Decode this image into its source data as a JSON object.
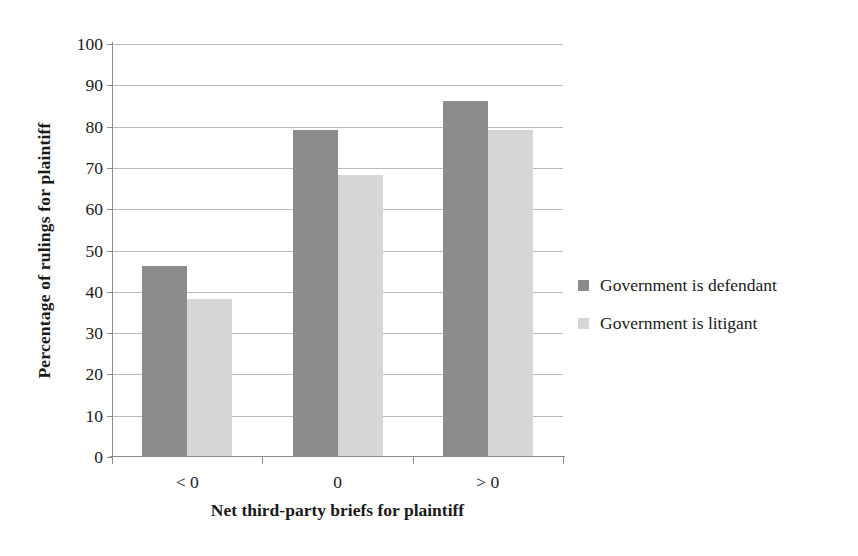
{
  "chart_data": {
    "type": "bar",
    "title": "",
    "xlabel": "Net third-party briefs for plaintiff",
    "ylabel": "Percentage of rulings for plaintiff",
    "categories": [
      "< 0",
      "0",
      "> 0"
    ],
    "series": [
      {
        "name": "Government is defendant",
        "color": "#8c8c8c",
        "values": [
          46,
          79,
          86
        ]
      },
      {
        "name": "Government is litigant",
        "color": "#d6d6d6",
        "values": [
          38,
          68,
          79
        ]
      }
    ],
    "ylim": [
      0,
      100
    ],
    "yticks": [
      0,
      10,
      20,
      30,
      40,
      50,
      60,
      70,
      80,
      90,
      100
    ],
    "ytick_labels": [
      "0",
      "10",
      "20",
      "30",
      "40",
      "50",
      "60",
      "70",
      "80",
      "90",
      "100"
    ],
    "grid": true,
    "legend_position": "right"
  },
  "legend": {
    "items": [
      {
        "label": "Government is defendant",
        "color": "#8c8c8c"
      },
      {
        "label": "Government is litigant",
        "color": "#d6d6d6"
      }
    ]
  },
  "page_bleed_text": ""
}
